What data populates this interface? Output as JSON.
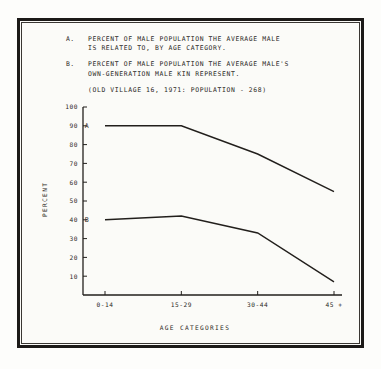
{
  "caption": {
    "items": [
      {
        "key": "A.",
        "text": "PERCENT OF MALE POPULATION THE AVERAGE MALE\nIS RELATED TO, BY AGE CATEGORY."
      },
      {
        "key": "B.",
        "text": "PERCENT OF MALE POPULATION THE AVERAGE MALE'S\nOWN-GENERATION MALE KIN REPRESENT."
      }
    ],
    "subtitle": "(OLD VILLAGE 16, 1971: POPULATION - 268)"
  },
  "chart_data": {
    "type": "line",
    "title": "",
    "categories": [
      "0-14",
      "15-29",
      "30-44",
      "45 +"
    ],
    "series": [
      {
        "name": "A",
        "values": [
          90,
          90,
          75,
          55
        ]
      },
      {
        "name": "B",
        "values": [
          40,
          42,
          33,
          7
        ]
      }
    ],
    "xlabel": "AGE CATEGORIES",
    "ylabel": "PERCENT",
    "ylim": [
      0,
      100
    ],
    "yticks": [
      10,
      20,
      30,
      40,
      50,
      60,
      70,
      80,
      90,
      100
    ],
    "ytick_labels": [
      "10",
      "20",
      "30",
      "40",
      "50",
      "60",
      "70",
      "80",
      "90",
      "100"
    ],
    "grid": false,
    "legend": "inline-series-labels",
    "line_color": "#221f1c"
  }
}
